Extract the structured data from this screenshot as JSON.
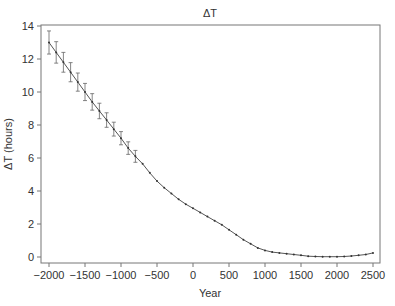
{
  "chart_data": {
    "type": "line",
    "title": "ΔT",
    "xlabel": "Year",
    "ylabel": "ΔT (hours)",
    "xlim": [
      -2100,
      2600
    ],
    "ylim": [
      -0.3,
      14
    ],
    "xticks": [
      -2000,
      -1500,
      -1000,
      -500,
      0,
      500,
      1000,
      1500,
      2000,
      2500
    ],
    "yticks": [
      0,
      2,
      4,
      6,
      8,
      10,
      12,
      14
    ],
    "grid": false,
    "legend": null,
    "series": [
      {
        "name": "ΔT",
        "x": [
          -2000,
          -1900,
          -1800,
          -1700,
          -1600,
          -1500,
          -1400,
          -1300,
          -1200,
          -1100,
          -1000,
          -900,
          -800,
          -700,
          -600,
          -500,
          -400,
          -300,
          -200,
          -100,
          0,
          100,
          200,
          300,
          400,
          500,
          600,
          700,
          800,
          900,
          1000,
          1100,
          1200,
          1300,
          1400,
          1500,
          1600,
          1700,
          1800,
          1900,
          2000,
          2100,
          2200,
          2300,
          2400,
          2500
        ],
        "y": [
          13.0,
          12.4,
          11.8,
          11.2,
          10.6,
          10.0,
          9.4,
          8.85,
          8.3,
          7.75,
          7.2,
          6.6,
          6.1,
          5.65,
          5.1,
          4.6,
          4.2,
          3.85,
          3.5,
          3.2,
          2.95,
          2.7,
          2.45,
          2.2,
          1.95,
          1.65,
          1.35,
          1.05,
          0.8,
          0.55,
          0.4,
          0.3,
          0.25,
          0.2,
          0.15,
          0.1,
          0.05,
          0.03,
          0.02,
          0.02,
          0.02,
          0.03,
          0.06,
          0.1,
          0.15,
          0.25
        ],
        "error": [
          0.7,
          0.65,
          0.6,
          0.58,
          0.55,
          0.52,
          0.5,
          0.47,
          0.44,
          0.42,
          0.4,
          0.38,
          0.36,
          0,
          0,
          0,
          0,
          0,
          0,
          0,
          0,
          0,
          0,
          0,
          0,
          0,
          0,
          0,
          0,
          0,
          0,
          0,
          0,
          0,
          0,
          0,
          0,
          0,
          0,
          0,
          0,
          0,
          0,
          0,
          0,
          0
        ]
      }
    ]
  }
}
